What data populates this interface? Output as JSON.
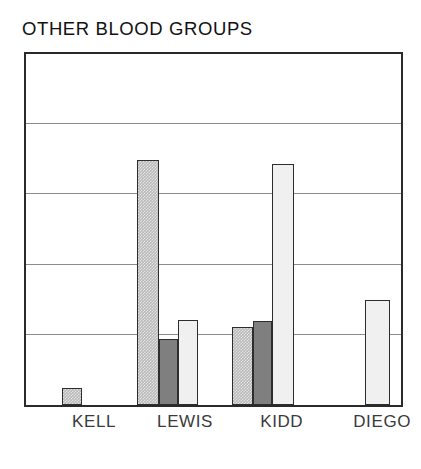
{
  "chart_data": {
    "type": "bar",
    "title": "OTHER BLOOD GROUPS",
    "xlabel": "",
    "ylabel": "",
    "categories": [
      "KELL",
      "LEWIS",
      "KIDD",
      "DIEGO"
    ],
    "ylim": [
      0,
      5
    ],
    "grid": true,
    "gridlines": [
      1,
      2,
      3,
      4
    ],
    "axis_tick_labels": [],
    "legend": "none",
    "legend_position": "none",
    "series": [
      {
        "name": "series-1",
        "fill": "dithered-light-gray",
        "color": "#b9b9b9",
        "values": [
          0.24,
          3.49,
          1.11,
          null
        ]
      },
      {
        "name": "series-2",
        "fill": "solid-dark-gray",
        "color": "#7f7f7f",
        "values": [
          null,
          0.94,
          1.2,
          null
        ]
      },
      {
        "name": "series-3",
        "fill": "near-white",
        "color": "#f0f0f0",
        "values": [
          null,
          1.21,
          3.44,
          1.49
        ]
      }
    ],
    "bars": [
      {
        "label": "kell-bar-1",
        "category": "KELL",
        "series": "series-1",
        "value": 0.24,
        "fill": "fill-a",
        "x_pct": 9.5,
        "w_pct": 5.5
      },
      {
        "label": "lewis-bar-1",
        "category": "LEWIS",
        "series": "series-1",
        "value": 3.49,
        "fill": "fill-a",
        "x_pct": 29.6,
        "w_pct": 5.8
      },
      {
        "label": "lewis-bar-2",
        "category": "LEWIS",
        "series": "series-2",
        "value": 0.94,
        "fill": "fill-b",
        "x_pct": 35.4,
        "w_pct": 5.0
      },
      {
        "label": "lewis-bar-3",
        "category": "LEWIS",
        "series": "series-3",
        "value": 1.21,
        "fill": "fill-c",
        "x_pct": 40.4,
        "w_pct": 5.5
      },
      {
        "label": "kidd-bar-1",
        "category": "KIDD",
        "series": "series-1",
        "value": 1.11,
        "fill": "fill-a",
        "x_pct": 54.9,
        "w_pct": 5.5
      },
      {
        "label": "kidd-bar-2",
        "category": "KIDD",
        "series": "series-2",
        "value": 1.2,
        "fill": "fill-b",
        "x_pct": 60.4,
        "w_pct": 5.3
      },
      {
        "label": "kidd-bar-3",
        "category": "KIDD",
        "series": "series-3",
        "value": 3.44,
        "fill": "fill-c",
        "x_pct": 65.7,
        "w_pct": 5.8
      },
      {
        "label": "diego-bar-1",
        "category": "DIEGO",
        "series": "series-3",
        "value": 1.49,
        "fill": "fill-c",
        "x_pct": 90.5,
        "w_pct": 6.6
      }
    ],
    "category_label_positions_pct": [
      18.5,
      42.5,
      68.0,
      94.5
    ]
  },
  "colors": {
    "frame": "#2a2a2a",
    "gridline": "#8c8c8c",
    "background": "#ffffff",
    "title": "#111111",
    "tick_label": "#3a3a3a"
  }
}
